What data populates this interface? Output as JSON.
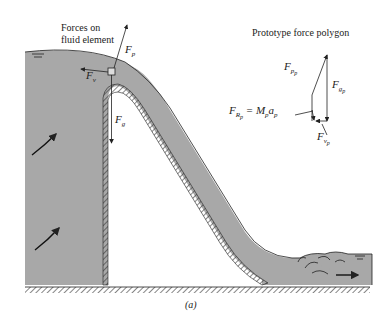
{
  "figure": {
    "caption": "(a)",
    "colors": {
      "fluid": "#a8a8a8",
      "line": "#222222",
      "background": "#ffffff"
    }
  },
  "labels": {
    "forces_on_element_line1": "Forces on",
    "forces_on_element_line2": "fluid element",
    "polygon_title": "Prototype force polygon",
    "F_p": "F",
    "F_p_sub": "p",
    "F_v": "F",
    "F_v_sub": "v",
    "F_g": "F",
    "F_g_sub": "g",
    "poly_Fp": "F",
    "poly_Fp_sub": "p",
    "poly_Fp_subsub": "p",
    "poly_Fg": "F",
    "poly_Fg_sub": "g",
    "poly_Fg_subsub": "p",
    "poly_Fv": "F",
    "poly_Fv_sub": "v",
    "poly_Fv_subsub": "p",
    "poly_FR": "F",
    "poly_FR_sub": "R",
    "poly_FR_subsub": "p",
    "poly_FR_eq": " = M",
    "poly_FR_eq_sub": "p",
    "poly_FR_a": "a",
    "poly_FR_a_sub": "p"
  }
}
